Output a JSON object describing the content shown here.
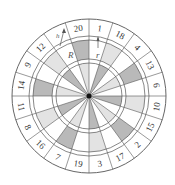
{
  "diagram": {
    "type": "dartboard",
    "center": [
      89,
      96
    ],
    "radii": {
      "outer": 77,
      "number_ring_inner": 60,
      "double_inner": 56,
      "treble_outer": 37,
      "treble_inner": 33,
      "bull": 2.5
    },
    "sector_angle_deg": 18,
    "start_angle_deg": 0,
    "sectors_clockwise_from_top": [
      "1",
      "18",
      "4",
      "13",
      "6",
      "10",
      "15",
      "2",
      "17",
      "3",
      "19",
      "7",
      "16",
      "8",
      "11",
      "14",
      "9",
      "12",
      "h",
      "20"
    ],
    "outer_fill": [
      "w",
      "L",
      "w",
      "D",
      "w",
      "L",
      "w",
      "D",
      "w",
      "L",
      "w",
      "D",
      "w",
      "L",
      "w",
      "D",
      "w",
      "L",
      "w",
      "D"
    ],
    "inner_fill": [
      "w",
      "D",
      "w",
      "L",
      "w",
      "D",
      "w",
      "L",
      "w",
      "D",
      "w",
      "L",
      "w",
      "D",
      "w",
      "L",
      "w",
      "D",
      "w",
      "L"
    ],
    "colors": {
      "w": "#ffffff",
      "L": "#e3e3e3",
      "D": "#b9b9b9",
      "line": "#555555",
      "bull": "#111111"
    },
    "annotations": {
      "big_radius_label": "R",
      "small_radius_label": "r",
      "height_label": "h"
    }
  }
}
